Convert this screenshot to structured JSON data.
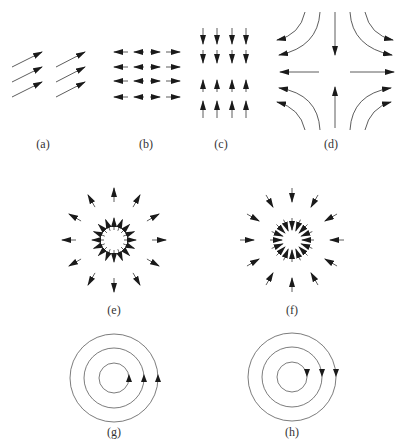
{
  "figure": {
    "stroke_color": "#1a1a1a",
    "background": "#ffffff"
  },
  "panels": [
    {
      "id": "a",
      "label": "(a)",
      "type": "uniform-diagonal-field",
      "label_x": 43,
      "label_y": 137
    },
    {
      "id": "b",
      "label": "(b)",
      "type": "horizontal-divergent-field",
      "label_x": 146,
      "label_y": 137
    },
    {
      "id": "c",
      "label": "(c)",
      "type": "vertical-convergent-field",
      "label_x": 221,
      "label_y": 137
    },
    {
      "id": "d",
      "label": "(d)",
      "type": "saddle-flow",
      "label_x": 331,
      "label_y": 137
    },
    {
      "id": "e",
      "label": "(e)",
      "type": "radial-source",
      "label_x": 114,
      "label_y": 303
    },
    {
      "id": "f",
      "label": "(f)",
      "type": "radial-sink",
      "label_x": 292,
      "label_y": 303
    },
    {
      "id": "g",
      "label": "(g)",
      "type": "counterclockwise-circulation",
      "label_x": 114,
      "label_y": 425
    },
    {
      "id": "h",
      "label": "(h)",
      "type": "clockwise-circulation",
      "label_x": 292,
      "label_y": 425
    }
  ]
}
